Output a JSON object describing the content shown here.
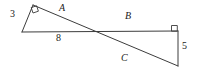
{
  "figure": {
    "type": "geometry-diagram",
    "stroke_color": "#3c3c3c",
    "background_color": "#ffffff",
    "text_color": "#1a1a1a",
    "labels": {
      "side_a": "A",
      "side_b": "B",
      "side_c": "C",
      "leg_left": "3",
      "base": "8",
      "leg_right": "5"
    },
    "right_angle_markers": [
      {
        "name": "right-angle-top-left",
        "x": 36,
        "y": 8
      },
      {
        "name": "right-angle-top-right",
        "x": 175,
        "y": 29
      }
    ],
    "vertices": {
      "apex_left": {
        "x": 33,
        "y": 5
      },
      "base_left": {
        "x": 22,
        "y": 32
      },
      "base_right": {
        "x": 178,
        "y": 31
      },
      "corner_bottom_right": {
        "x": 178,
        "y": 66
      }
    }
  }
}
